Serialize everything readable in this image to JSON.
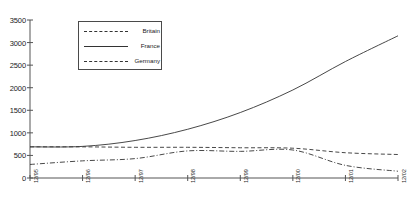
{
  "chart_data": {
    "type": "line",
    "title": "",
    "xlabel": "",
    "ylabel": "",
    "ylim": [
      0,
      3500
    ],
    "ytick_step": 500,
    "grid": false,
    "legend_position": "top-left-inside",
    "categories": [
      "12/95",
      "12/96",
      "12/97",
      "12/98",
      "12/99",
      "12/00",
      "12/01",
      "12/02"
    ],
    "yticks": [
      "0",
      "500",
      "1000",
      "1500",
      "2000",
      "2500",
      "3000",
      "3500"
    ],
    "series": [
      {
        "name": "Britain",
        "style": "dashed",
        "color": "#333333",
        "values": [
          690,
          690,
          680,
          680,
          670,
          660,
          560,
          520
        ]
      },
      {
        "name": "France",
        "style": "solid",
        "color": "#333333",
        "values": [
          690,
          700,
          830,
          1080,
          1450,
          1950,
          2580,
          3150
        ]
      },
      {
        "name": "Germany",
        "style": "dash-dot",
        "color": "#333333",
        "values": [
          300,
          380,
          430,
          600,
          590,
          620,
          280,
          150
        ]
      }
    ]
  },
  "axes": {
    "plot_left": 30,
    "plot_right": 398,
    "plot_top": 20,
    "plot_bottom": 178,
    "axis_color": "#555555"
  },
  "header": {
    "faint_text": ""
  }
}
